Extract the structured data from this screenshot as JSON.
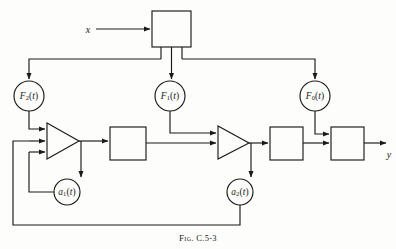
{
  "figure": {
    "caption_prefix": "Fig.",
    "caption_number": "C.5-3",
    "caption_full": "Fig. C.5-3"
  },
  "io": {
    "input_label": "x",
    "output_label": "y"
  },
  "blocks": [
    {
      "id": "top-block",
      "label": "",
      "x": 152,
      "y": 11,
      "w": 39,
      "h": 36
    },
    {
      "id": "block-1",
      "label": "",
      "x": 110,
      "y": 127,
      "w": 36,
      "h": 33
    },
    {
      "id": "block-2",
      "label": "",
      "x": 270,
      "y": 127,
      "w": 33,
      "h": 33
    },
    {
      "id": "block-3",
      "label": "",
      "x": 331,
      "y": 127,
      "w": 33,
      "h": 33
    }
  ],
  "circles": [
    {
      "id": "F2",
      "label": "F₂(t)",
      "base": "F",
      "sub": "2",
      "arg": "(t)",
      "cx": 29,
      "cy": 96,
      "r": 15
    },
    {
      "id": "F1",
      "label": "F₁(t)",
      "base": "F",
      "sub": "1",
      "arg": "(t)",
      "cx": 170,
      "cy": 96,
      "r": 15
    },
    {
      "id": "F0",
      "label": "F₀(t)",
      "base": "F",
      "sub": "0",
      "arg": "(t)",
      "cx": 315,
      "cy": 96,
      "r": 15
    },
    {
      "id": "a1",
      "label": "a₁(t)",
      "base": "a",
      "sub": "1",
      "arg": "(t)",
      "cx": 67,
      "cy": 192,
      "r": 13
    },
    {
      "id": "a2",
      "label": "a₂(t)",
      "base": "a",
      "sub": "2",
      "arg": "(t)",
      "cx": 240,
      "cy": 192,
      "r": 13
    }
  ],
  "amplifiers": [
    {
      "id": "amp-1",
      "inputs": 3,
      "x": 47,
      "y": 123,
      "w": 32,
      "h": 36
    },
    {
      "id": "amp-2",
      "inputs": 2,
      "x": 218,
      "y": 126,
      "w": 31,
      "h": 33
    }
  ],
  "colors": {
    "line": "#1a1a1a",
    "background": "#fdfdfb",
    "text": "#1a1a1a"
  }
}
